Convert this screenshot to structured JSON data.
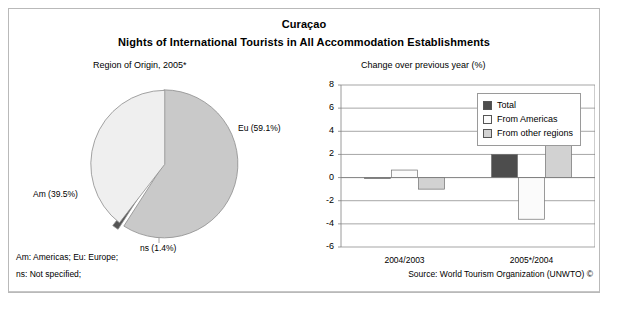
{
  "figure": {
    "title": "Curaçao",
    "subtitle": "Nights of International Tourists in All Accommodation Establishments",
    "pie_caption": "Region of Origin, 2005*",
    "bar_caption": "Change over previous year (%)"
  },
  "footer": {
    "abbr_line1": "Am: Americas; Eu: Europe;",
    "abbr_line2": "ns: Not specified;",
    "source": "Source: World Tourism Organization (UNWTO) ©"
  },
  "colors": {
    "europe_slice": "#c9c9c9",
    "americas_slice": "#efefef",
    "ns_slice": "#555555",
    "total_bar": "#4d4d4d",
    "americas_bar": "#fbfbfb",
    "other_bar": "#d2d2d2",
    "frame": "#b9b9b9",
    "axis": "#808080"
  },
  "chart_data": [
    {
      "type": "pie",
      "title": "Region of Origin, 2005*",
      "categories": [
        "Eu",
        "Am",
        "ns"
      ],
      "values": [
        59.1,
        39.5,
        1.4
      ],
      "labels": [
        "Eu (59.1%)",
        "Am (39.5%)",
        "ns (1.4%)"
      ],
      "unit": "%",
      "exploded": true,
      "legend": "none"
    },
    {
      "type": "bar",
      "title": "Change over previous year (%)",
      "categories": [
        "2004/2003",
        "2005*/2004"
      ],
      "series": [
        {
          "name": "Total",
          "values": [
            0.0,
            2.0
          ]
        },
        {
          "name": "From Americas",
          "values": [
            0.65,
            -3.6
          ]
        },
        {
          "name": "From other regions",
          "values": [
            -1.0,
            7.2
          ]
        }
      ],
      "xlabel": "",
      "ylabel": "",
      "ylim": [
        -6,
        8
      ],
      "yticks": [
        8,
        6,
        4,
        2,
        0,
        -2,
        -4,
        -6
      ],
      "grid": true,
      "legend_position": "top-right"
    }
  ]
}
